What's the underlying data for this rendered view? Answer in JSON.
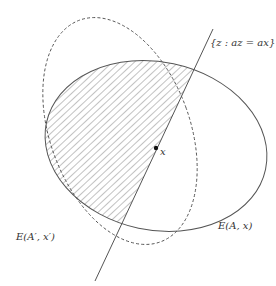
{
  "diagram": {
    "labels": {
      "line": "{z : az = ax}",
      "point": "x",
      "solid_ellipse": "E(A, x)",
      "dashed_ellipse": "E(A′, x′)"
    },
    "colors": {
      "stroke": "#555555",
      "hatch": "#666666",
      "point": "#111111",
      "background": "#ffffff"
    }
  }
}
